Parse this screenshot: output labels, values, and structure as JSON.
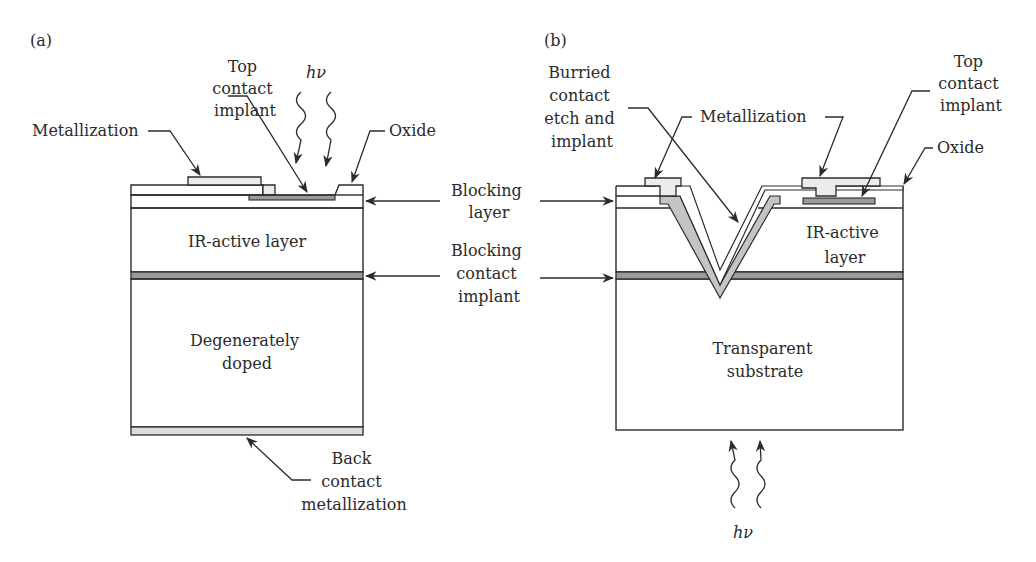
{
  "panel_a": {
    "tag": "(a)",
    "labels": {
      "top_contact_implant": [
        "Top",
        "contact",
        "implant"
      ],
      "photon": "hν",
      "metallization": "Metallization",
      "oxide": "Oxide",
      "ir_active_layer": "IR-active layer",
      "substrate": [
        "Degenerately",
        "doped"
      ],
      "back_contact": [
        "Back",
        "contact",
        "metallization"
      ]
    }
  },
  "shared_labels": {
    "blocking_layer": [
      "Blocking",
      "layer"
    ],
    "blocking_contact_implant": [
      "Blocking",
      "contact",
      "implant"
    ]
  },
  "panel_b": {
    "tag": "(b)",
    "labels": {
      "buried_contact": [
        "Burried",
        "contact",
        "etch and",
        "implant"
      ],
      "metallization": "Metallization",
      "top_contact_implant": [
        "Top",
        "contact",
        "implant"
      ],
      "oxide": "Oxide",
      "ir_active_layer": [
        "IR-active",
        "layer"
      ],
      "substrate": [
        "Transparent",
        "substrate"
      ],
      "photon": "hν"
    }
  },
  "colors": {
    "line": "#2b2b2b",
    "metal_fill": "#ececec",
    "implant_fill": "#9a9a9a",
    "buried_fill": "#c4c4c4",
    "back_metal_fill": "#dcdcdc"
  }
}
